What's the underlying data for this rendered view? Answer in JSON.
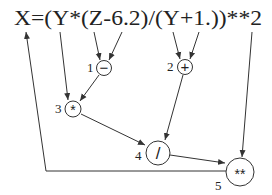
{
  "diagram": {
    "expression": "X=(Y*(Z-6.2)/(Y+1.))**2",
    "nodes": [
      {
        "id": 1,
        "label": "1",
        "op": "−"
      },
      {
        "id": 2,
        "label": "2",
        "op": "+"
      },
      {
        "id": 3,
        "label": "3",
        "op": "*"
      },
      {
        "id": 4,
        "label": "4",
        "op": "/"
      },
      {
        "id": 5,
        "label": "5",
        "op": "**"
      }
    ],
    "edges": [
      {
        "from": "Z",
        "to": 1
      },
      {
        "from": "6.2",
        "to": 1
      },
      {
        "from": "Y",
        "to": 3
      },
      {
        "from": 1,
        "to": 3
      },
      {
        "from": "Y",
        "to": 2
      },
      {
        "from": "1.",
        "to": 2
      },
      {
        "from": 3,
        "to": 4
      },
      {
        "from": 2,
        "to": 4
      },
      {
        "from": 4,
        "to": 5
      },
      {
        "from": "2",
        "to": 5
      },
      {
        "from": 5,
        "to": "X"
      }
    ]
  }
}
